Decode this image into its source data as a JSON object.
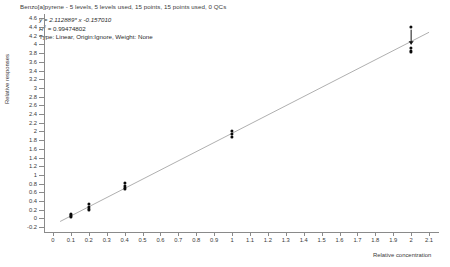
{
  "chart_data": {
    "type": "scatter",
    "title": "Benzo[a]pyrene - 5 levels, 5 levels used, 15 points, 15 points used, 0 QCs",
    "xlabel": "Relative concentration",
    "ylabel": "Relative responses",
    "xlim": [
      -0.05,
      2.15
    ],
    "ylim": [
      -0.3,
      4.7
    ],
    "grid": false,
    "legend": null,
    "annotations": {
      "equation": "y = 2.112889* x  -0.157010",
      "r_squared_label": "R",
      "r_squared_exponent": "2",
      "r_squared_value": " = 0.99474802",
      "fit_type": "Type: Linear, Origin:Ignore, Weight: None"
    },
    "fit": {
      "slope": 2.112889,
      "intercept": -0.15701,
      "r_squared": 0.99474802,
      "type": "Linear",
      "origin": "Ignore",
      "weight": "None"
    },
    "xticks": [
      "0",
      "0.1",
      "0.2",
      "0.3",
      "0.4",
      "0.5",
      "0.6",
      "0.7",
      "0.8",
      "0.9",
      "1",
      "1.1",
      "1.2",
      "1.3",
      "1.4",
      "1.5",
      "1.6",
      "1.7",
      "1.8",
      "1.9",
      "2",
      "2.1"
    ],
    "xtick_values": [
      0,
      0.1,
      0.2,
      0.3,
      0.4,
      0.5,
      0.6,
      0.7,
      0.8,
      0.9,
      1.0,
      1.1,
      1.2,
      1.3,
      1.4,
      1.5,
      1.6,
      1.7,
      1.8,
      1.9,
      2.0,
      2.1
    ],
    "yticks": [
      "4.6",
      "4.4",
      "4.2",
      "4",
      "3.8",
      "3.6",
      "3.4",
      "3.2",
      "3",
      "2.8",
      "2.6",
      "2.4",
      "2.2",
      "2",
      "1.8",
      "1.6",
      "1.4",
      "1.2",
      "1",
      "0.8",
      "0.6",
      "0.4",
      "0.2",
      "0",
      "-0.2"
    ],
    "ytick_values": [
      4.6,
      4.4,
      4.2,
      4.0,
      3.8,
      3.6,
      3.4,
      3.2,
      3.0,
      2.8,
      2.6,
      2.4,
      2.2,
      2.0,
      1.8,
      1.6,
      1.4,
      1.2,
      1.0,
      0.8,
      0.6,
      0.4,
      0.2,
      0,
      -0.2
    ],
    "series": [
      {
        "name": "Calibration points",
        "marker": "filled-circle",
        "color": "#0a0a0a",
        "points": [
          {
            "x": 0.1,
            "y": 0.03
          },
          {
            "x": 0.1,
            "y": 0.07
          },
          {
            "x": 0.1,
            "y": 0.11
          },
          {
            "x": 0.2,
            "y": 0.21
          },
          {
            "x": 0.2,
            "y": 0.27
          },
          {
            "x": 0.2,
            "y": 0.33
          },
          {
            "x": 0.4,
            "y": 0.69
          },
          {
            "x": 0.4,
            "y": 0.75
          },
          {
            "x": 0.4,
            "y": 0.81
          },
          {
            "x": 1.0,
            "y": 1.87
          },
          {
            "x": 1.0,
            "y": 1.94
          },
          {
            "x": 1.0,
            "y": 2.01
          },
          {
            "x": 2.0,
            "y": 4.4
          },
          {
            "x": 2.0,
            "y": 3.92
          },
          {
            "x": 2.0,
            "y": 3.84
          }
        ]
      }
    ],
    "fit_line_endpoints": [
      {
        "x": 0.04,
        "y": -0.07
      },
      {
        "x": 2.1,
        "y": 4.28
      }
    ],
    "marker_annotation": {
      "name": "down-arrow",
      "x": 2.0,
      "y_from": 4.34,
      "y_to": 4.0
    }
  }
}
